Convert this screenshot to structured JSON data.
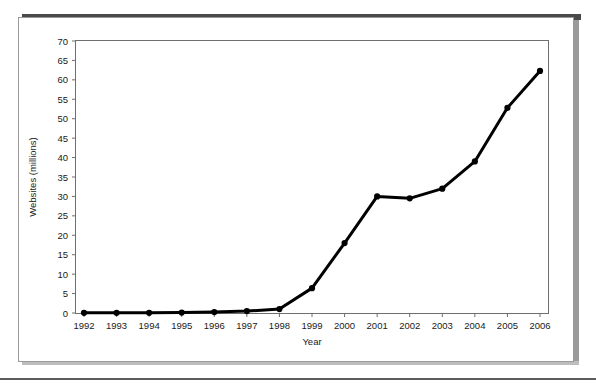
{
  "figure": {
    "background_color": "#ffffff",
    "panel_border_color": "#9a9a9a",
    "shadow_color": "#4a4a4a",
    "rule_color": "#5d5d5d"
  },
  "chart_data": {
    "type": "line",
    "title": "",
    "subtitle": "",
    "xlabel": "Year",
    "ylabel": "Websites (millions)",
    "categories": [
      "1992",
      "1993",
      "1994",
      "1995",
      "1996",
      "1997",
      "1998",
      "1999",
      "2000",
      "2001",
      "2002",
      "2003",
      "2004",
      "2005",
      "2006"
    ],
    "x": [
      1992,
      1993,
      1994,
      1995,
      1996,
      1997,
      1998,
      1999,
      2000,
      2001,
      2002,
      2003,
      2004,
      2005,
      2006
    ],
    "values": [
      0.05,
      0.05,
      0.05,
      0.1,
      0.25,
      0.5,
      1.0,
      6.4,
      18.0,
      30.0,
      29.5,
      32.0,
      39.0,
      52.8,
      62.3
    ],
    "series": [
      {
        "name": "Websites",
        "values": [
          0.05,
          0.05,
          0.05,
          0.1,
          0.25,
          0.5,
          1.0,
          6.4,
          18.0,
          30.0,
          29.5,
          32.0,
          39.0,
          52.8,
          62.3
        ],
        "color": "#000000",
        "marker": "circle",
        "line_width": 3
      }
    ],
    "ylim": [
      0,
      70
    ],
    "ytick_values": [
      0,
      5,
      10,
      15,
      20,
      25,
      30,
      35,
      40,
      45,
      50,
      55,
      60,
      65,
      70
    ],
    "ytick_labels": [
      "0",
      "5",
      "10",
      "15",
      "20",
      "25",
      "30",
      "35",
      "40",
      "45",
      "50",
      "55",
      "60",
      "65",
      "70"
    ],
    "xtick_labels": [
      "1992",
      "1993",
      "1994",
      "1995",
      "1996",
      "1997",
      "1998",
      "1999",
      "2000",
      "2001",
      "2002",
      "2003",
      "2004",
      "2005",
      "2006"
    ],
    "grid": false,
    "legend": null,
    "legend_position": "none",
    "annotations": []
  }
}
